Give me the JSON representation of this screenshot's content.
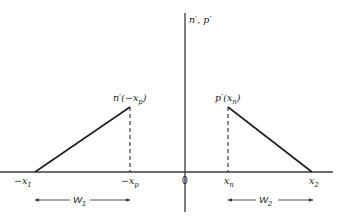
{
  "diagram": {
    "type": "excess-carrier-profile",
    "axis_label": "n′, p′",
    "origin_label": "0",
    "colors": {
      "line": "#1e1e1e",
      "axis": "#3a3a3a",
      "background": "#ffffff"
    },
    "x_labels": {
      "neg_x1": {
        "prefix": "−x",
        "sub": "1"
      },
      "neg_xp": {
        "prefix": "−x",
        "sub": "p"
      },
      "xn": {
        "prefix": "x",
        "sub": "n"
      },
      "x2": {
        "prefix": "x",
        "sub": "2"
      }
    },
    "peak_labels": {
      "left": {
        "pre": "n′(−x",
        "sub": "p",
        "post": ")"
      },
      "right": {
        "pre": "p′(x",
        "sub": "n",
        "post": ")"
      }
    },
    "widths": {
      "w1": {
        "main": "W",
        "sub": "1"
      },
      "w2": {
        "main": "W",
        "sub": "2"
      }
    },
    "profiles": [
      {
        "name": "n-prime",
        "region": "p-side",
        "from": "-x1",
        "to": "-xp",
        "shape": "linear rise, dashed drop at -xp"
      },
      {
        "name": "p-prime",
        "region": "n-side",
        "from": "xn",
        "to": "x2",
        "shape": "dashed rise at xn, linear decay"
      }
    ]
  }
}
